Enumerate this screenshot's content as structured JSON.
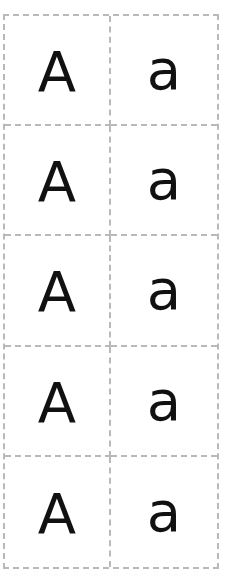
{
  "worksheet": {
    "title": "",
    "rows": [
      {
        "upper": "A",
        "lower": "a"
      },
      {
        "upper": "A",
        "lower": "a"
      },
      {
        "upper": "A",
        "lower": "a"
      },
      {
        "upper": "A",
        "lower": "a"
      },
      {
        "upper": "A",
        "lower": "a"
      }
    ],
    "colors": {
      "border": "#b9b9b9",
      "letter": "#111111",
      "background": "#ffffff"
    }
  }
}
